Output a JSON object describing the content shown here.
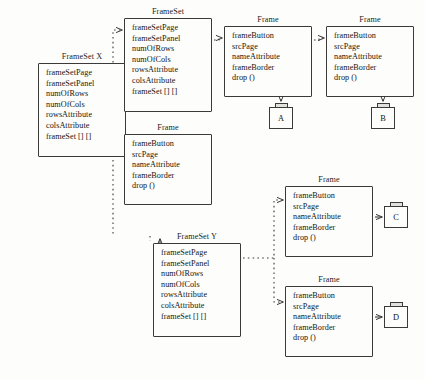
{
  "diagram": {
    "background_color": "#fdfdfb",
    "line_color": "#3a3a38",
    "text_color": "#16160f"
  },
  "frameset_attributes": [
    "frameSetPage",
    "frameSetPanel",
    "numOfRows",
    "numOfCols",
    "rowsAttribute",
    "colsAttribute",
    "frameSet [] []"
  ],
  "frame_attributes": [
    "frameButton",
    "srcPage",
    "nameAttribute",
    "frameBorder",
    "drop ()"
  ],
  "nodes": [
    {
      "id": "frameset-x",
      "title": "FrameSet X",
      "kind": "frameset",
      "x": 38,
      "y": 63,
      "w": 88,
      "h": 94,
      "title_x": 26,
      "title_y": 52,
      "title_w": 112,
      "attrs": [
        "frameSetPage",
        "frameSetPanel",
        "numOfRows",
        "numOfCols",
        "rowsAttribute",
        "colsAttribute",
        "frameSet [] []"
      ]
    },
    {
      "id": "frameset-top",
      "title": "FrameSet",
      "kind": "frameset",
      "x": 124,
      "y": 18,
      "w": 88,
      "h": 94,
      "title_x": 112,
      "title_y": 7,
      "title_w": 112,
      "attrs": [
        "frameSetPage",
        "frameSetPanel",
        "numOfRows",
        "numOfCols",
        "rowsAttribute",
        "colsAttribute",
        "frameSet [] []"
      ]
    },
    {
      "id": "frame-left-mid",
      "title": "Frame",
      "kind": "frame",
      "x": 124,
      "y": 134,
      "w": 88,
      "h": 71,
      "title_x": 112,
      "title_y": 123,
      "title_w": 112,
      "attrs": [
        "frameButton",
        "srcPage",
        "nameAttribute",
        "frameBorder",
        "drop ()"
      ]
    },
    {
      "id": "frameset-y",
      "title": "FrameSet Y",
      "kind": "frameset",
      "x": 153,
      "y": 243,
      "w": 88,
      "h": 94,
      "title_x": 141,
      "title_y": 232,
      "title_w": 112,
      "attrs": [
        "frameSetPage",
        "frameSetPanel",
        "numOfRows",
        "numOfCols",
        "rowsAttribute",
        "colsAttribute",
        "frameSet [] []"
      ]
    },
    {
      "id": "frame-a",
      "title": "Frame",
      "kind": "frame",
      "x": 224,
      "y": 26,
      "w": 88,
      "h": 71,
      "title_x": 212,
      "title_y": 15,
      "title_w": 112,
      "attrs": [
        "frameButton",
        "srcPage",
        "nameAttribute",
        "frameBorder",
        "drop ()"
      ]
    },
    {
      "id": "frame-b",
      "title": "Frame",
      "kind": "frame",
      "x": 326,
      "y": 26,
      "w": 88,
      "h": 71,
      "title_x": 314,
      "title_y": 15,
      "title_w": 112,
      "attrs": [
        "frameButton",
        "srcPage",
        "nameAttribute",
        "frameBorder",
        "drop ()"
      ]
    },
    {
      "id": "frame-c",
      "title": "Frame",
      "kind": "frame",
      "x": 285,
      "y": 186,
      "w": 88,
      "h": 71,
      "title_x": 273,
      "title_y": 175,
      "title_w": 112,
      "attrs": [
        "frameButton",
        "srcPage",
        "nameAttribute",
        "frameBorder",
        "drop ()"
      ]
    },
    {
      "id": "frame-d",
      "title": "Frame",
      "kind": "frame",
      "x": 285,
      "y": 286,
      "w": 88,
      "h": 71,
      "title_x": 273,
      "title_y": 275,
      "title_w": 112,
      "attrs": [
        "frameButton",
        "srcPage",
        "nameAttribute",
        "frameBorder",
        "drop ()"
      ]
    }
  ],
  "page_nodes": [
    {
      "id": "page-a",
      "label": "A",
      "x": 269,
      "y": 107,
      "w": 24,
      "h": 22,
      "tab_x": 275,
      "tab_y": 103,
      "tab_w": 13,
      "tab_h": 4
    },
    {
      "id": "page-b",
      "label": "B",
      "x": 371,
      "y": 107,
      "w": 24,
      "h": 22,
      "tab_x": 377,
      "tab_y": 103,
      "tab_w": 13,
      "tab_h": 4
    },
    {
      "id": "page-c",
      "label": "C",
      "x": 384,
      "y": 206,
      "w": 24,
      "h": 22,
      "tab_x": 390,
      "tab_y": 202,
      "tab_w": 13,
      "tab_h": 4
    },
    {
      "id": "page-d",
      "label": "D",
      "x": 384,
      "y": 306,
      "w": 24,
      "h": 22,
      "tab_x": 390,
      "tab_y": 302,
      "tab_w": 13,
      "tab_h": 4
    }
  ]
}
